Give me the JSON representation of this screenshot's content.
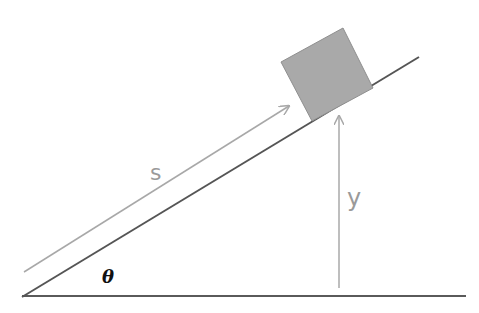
{
  "diagram": {
    "labels": {
      "distance": "s",
      "height": "y",
      "angle": "θ"
    },
    "colors": {
      "line": "#555555",
      "arrow": "#a8a8a8",
      "block_fill": "#a9a9a9",
      "label": "#9a9a9a",
      "angle_label": "#111111"
    }
  }
}
